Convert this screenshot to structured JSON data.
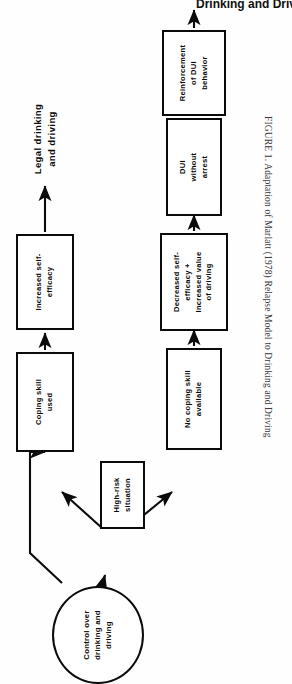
{
  "page": {
    "running_head": "Drinking and Driving",
    "caption": "FIGURE 1. Adaptation of Marlatt (1978) Relapse Model to Drinking and Driving",
    "background_color": "#ffffff",
    "ink_color": "#0b0b0b"
  },
  "figure": {
    "title_label": "Legal drinking\nand driving",
    "orientation": "rotated-90-ccw",
    "nodes": [
      {
        "id": "control-over-drinking",
        "shape": "oval",
        "label": "Control over\ndrinking and\ndriving"
      },
      {
        "id": "high-risk-situation",
        "shape": "box",
        "label": "High-risk\nsituation"
      },
      {
        "id": "coping-skill-used",
        "shape": "box",
        "label": "Coping skill\nused"
      },
      {
        "id": "increased-self-efficacy",
        "shape": "box",
        "label": "Increased self-\nefficacy"
      },
      {
        "id": "legal-drinking-and-driving",
        "shape": "text",
        "label": "Legal drinking\nand driving"
      },
      {
        "id": "no-coping-skill-available",
        "shape": "box",
        "label": "No coping skill\navailable"
      },
      {
        "id": "decreased-self-efficacy",
        "shape": "box",
        "label": "Decreased self-\nefficacy +\nIncreased value\nof driving"
      },
      {
        "id": "dui-without-arrest",
        "shape": "box",
        "label": "DUI\nwithout\narrest"
      },
      {
        "id": "reinforcement-of-dui-behavior",
        "shape": "box",
        "label": "Reinforcement\nof DUI\nbehavior"
      }
    ],
    "edges": [
      {
        "from": "control-over-drinking",
        "to": "high-risk-situation"
      },
      {
        "from": "control-over-drinking",
        "to": "coping-skill-used"
      },
      {
        "from": "high-risk-situation",
        "to": "coping-skill-used"
      },
      {
        "from": "high-risk-situation",
        "to": "no-coping-skill-available"
      },
      {
        "from": "coping-skill-used",
        "to": "increased-self-efficacy"
      },
      {
        "from": "increased-self-efficacy",
        "to": "legal-drinking-and-driving"
      },
      {
        "from": "no-coping-skill-available",
        "to": "decreased-self-efficacy"
      },
      {
        "from": "decreased-self-efficacy",
        "to": "dui-without-arrest"
      },
      {
        "from": "dui-without-arrest",
        "to": "reinforcement-of-dui-behavior"
      },
      {
        "from": "reinforcement-of-dui-behavior",
        "to": "top-exit"
      }
    ]
  }
}
